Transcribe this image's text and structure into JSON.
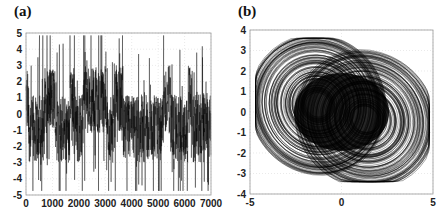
{
  "chart_data": [
    {
      "panel_label": "(a)",
      "type": "line",
      "title": "",
      "xlabel": "",
      "ylabel": "",
      "xlim": [
        0,
        7000
      ],
      "ylim": [
        -5,
        5
      ],
      "x_ticks": [
        "0",
        "1000",
        "2000",
        "3000",
        "4000",
        "5000",
        "6000",
        "7000"
      ],
      "y_ticks": [
        "5",
        "4",
        "3",
        "2",
        "1",
        "0",
        "-1",
        "-2",
        "-3",
        "-4",
        "-5"
      ],
      "grid": true,
      "legend": null,
      "description": "Chaotic time series of ~7000 samples oscillating densely between about -4.7 and 4.8, switching irregularly between positive (around +1) and negative (around -1) lobes",
      "series": [
        {
          "name": "signal",
          "color": "#000000",
          "range_min": -4.7,
          "range_max": 4.8,
          "n_points": 7000
        }
      ]
    },
    {
      "panel_label": "(b)",
      "type": "line",
      "title": "",
      "xlabel": "",
      "ylabel": "",
      "xlim": [
        -5,
        5
      ],
      "ylim": [
        -4,
        4
      ],
      "x_ticks": [
        "-5",
        "0",
        "5"
      ],
      "y_ticks": [
        "4",
        "3",
        "2",
        "1",
        "0",
        "-1",
        "-2",
        "-3",
        "-4"
      ],
      "grid": true,
      "legend": null,
      "description": "Phase portrait of a double-scroll chaotic attractor; two overlapping scroll lobes centered near (-1.5, 0.5) and (1.5, -0.5), spanning x from -4.7 to 4.8 and y from -3.4 to 3.6",
      "series": [
        {
          "name": "attractor",
          "color": "#000000",
          "x_range": [
            -4.7,
            4.8
          ],
          "y_range": [
            -3.4,
            3.6
          ]
        }
      ]
    }
  ],
  "panels": {
    "a": {
      "label": "(a)"
    },
    "b": {
      "label": "(b)"
    }
  }
}
